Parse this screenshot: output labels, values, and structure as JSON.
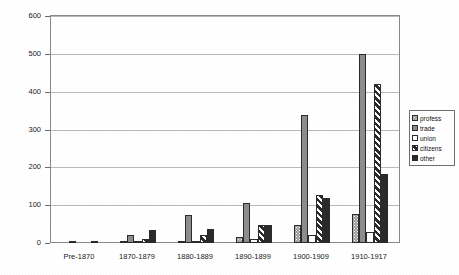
{
  "chart_data": {
    "type": "bar",
    "title": "",
    "xlabel": "",
    "ylabel": "",
    "ylim": [
      0,
      600
    ],
    "ytick_step": 100,
    "grid": true,
    "legend_position": "right",
    "categories": [
      "Pre-1870",
      "1870-1879",
      "1880-1889",
      "1890-1899",
      "1900-1909",
      "1910-1917"
    ],
    "ytick_labels": [
      "0",
      "100",
      "200",
      "300",
      "400",
      "500",
      "600"
    ],
    "series": [
      {
        "name": "profess",
        "pattern": "dotted-gray",
        "values": [
          0,
          4,
          3,
          15,
          48,
          78
        ]
      },
      {
        "name": "trade",
        "pattern": "solid-gray",
        "values": [
          2,
          20,
          75,
          105,
          338,
          500
        ]
      },
      {
        "name": "union",
        "pattern": "white",
        "values": [
          0,
          3,
          6,
          10,
          22,
          30
        ]
      },
      {
        "name": "citizens",
        "pattern": "diagonal-hatch",
        "values": [
          0,
          10,
          20,
          48,
          128,
          420
        ]
      },
      {
        "name": "other",
        "pattern": "solid-black",
        "values": [
          6,
          35,
          38,
          48,
          118,
          182
        ]
      }
    ]
  },
  "legend": {
    "items": [
      {
        "label": "profess"
      },
      {
        "label": "trade"
      },
      {
        "label": "union"
      },
      {
        "label": "citizens"
      },
      {
        "label": "other"
      }
    ]
  }
}
